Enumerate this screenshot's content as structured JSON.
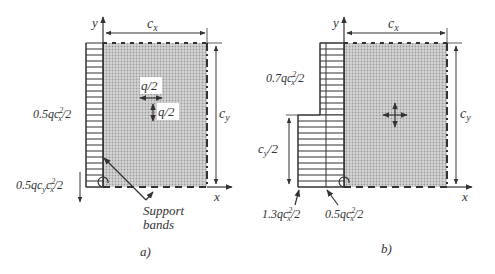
{
  "figure_a": {
    "caption": "a)",
    "axis_y": "y",
    "axis_x": "x",
    "dim_width": "c",
    "dim_width_sub": "x",
    "dim_height": "c",
    "dim_height_sub": "y",
    "moment_top_label": "0.5qc",
    "moment_top_sup": "2",
    "moment_top_sub": "x",
    "moment_top_tail": "/2",
    "moment_bottom_label": "0.5qc",
    "moment_bottom_sub1": "y",
    "moment_bottom_c": "c",
    "moment_bottom_sup": "2",
    "moment_bottom_sub2": "x",
    "moment_bottom_tail": "/2",
    "load_h": "q/2",
    "load_v": "q/2",
    "support_label_1": "Support",
    "support_label_2": "bands"
  },
  "figure_b": {
    "caption": "b)",
    "axis_y": "y",
    "axis_x": "x",
    "dim_width": "c",
    "dim_width_sub": "x",
    "dim_height": "c",
    "dim_height_sub": "y",
    "half_height": "c",
    "half_height_sub": "y",
    "half_height_tail": "/2",
    "moment_upper_label": "0.7qc",
    "moment_upper_sup": "2",
    "moment_upper_sub": "x",
    "moment_upper_tail": "/2",
    "moment_lower_outer_label": "1.3qc",
    "moment_lower_outer_sup": "2",
    "moment_lower_outer_sub": "x",
    "moment_lower_outer_tail": "/2",
    "moment_lower_inner_label": "0.5qc",
    "moment_lower_inner_sup": "2",
    "moment_lower_inner_sub": "x",
    "moment_lower_inner_tail": "/2"
  },
  "colors": {
    "ink": "#333333",
    "plate_fill": "#c8c8c8"
  }
}
